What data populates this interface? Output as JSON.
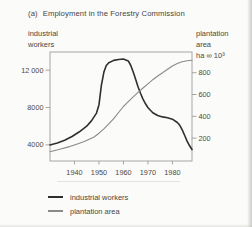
{
  "labels": {
    "title_index": "(a)",
    "title_text": "Employment in the Forestry Commission",
    "left_axis_line1": "industrial",
    "left_axis_line2": "workers",
    "right_axis_line1": "plantation",
    "right_axis_line2": "area",
    "right_axis_line3": "ha ∞ 10³"
  },
  "legend": {
    "items": [
      {
        "label": "industrial workers"
      },
      {
        "label": "plantation area"
      }
    ]
  },
  "colors": {
    "industrial_line": "#2f2f2f",
    "plantation_line": "#8a8a8a",
    "axis": "#9c9c9c",
    "text": "#4a4a4a",
    "background": "#fbfbf9"
  },
  "chart_data": {
    "type": "line",
    "grid": false,
    "legend_position": "bottom-left",
    "x_axis": {
      "label": "year",
      "range": [
        1930,
        1988
      ],
      "ticks": [
        {
          "v": 1940,
          "label": "1940"
        },
        {
          "v": 1950,
          "label": "1950"
        },
        {
          "v": 1960,
          "label": "1960"
        },
        {
          "v": 1970,
          "label": "1970"
        },
        {
          "v": 1980,
          "label": "1980"
        }
      ]
    },
    "left_axis": {
      "label": "industrial workers",
      "range": [
        2270,
        13950
      ],
      "ticks": [
        {
          "v": 4000,
          "label": "4000"
        },
        {
          "v": 8000,
          "label": "8000"
        },
        {
          "v": 12000,
          "label": "12 000"
        }
      ]
    },
    "right_axis": {
      "label": "plantation area ha ∞ 10³",
      "range": [
        -10,
        990
      ],
      "ticks": [
        {
          "v": 200,
          "label": "200"
        },
        {
          "v": 400,
          "label": "400"
        },
        {
          "v": 600,
          "label": "600"
        },
        {
          "v": 800,
          "label": "800"
        }
      ]
    },
    "series": [
      {
        "name": "industrial workers",
        "axis": "left",
        "color": "#2f2f2f",
        "width": 1.6,
        "points": [
          [
            1930,
            4000
          ],
          [
            1933,
            4200
          ],
          [
            1936,
            4500
          ],
          [
            1939,
            4900
          ],
          [
            1942,
            5400
          ],
          [
            1945,
            6000
          ],
          [
            1947,
            6600
          ],
          [
            1949,
            7400
          ],
          [
            1950,
            8300
          ],
          [
            1951,
            10400
          ],
          [
            1952,
            11800
          ],
          [
            1953,
            12500
          ],
          [
            1954,
            12800
          ],
          [
            1956,
            13050
          ],
          [
            1958,
            13150
          ],
          [
            1960,
            13200
          ],
          [
            1962,
            13000
          ],
          [
            1963,
            12500
          ],
          [
            1964,
            11800
          ],
          [
            1965,
            11000
          ],
          [
            1966,
            10200
          ],
          [
            1967,
            9500
          ],
          [
            1968,
            8900
          ],
          [
            1969,
            8400
          ],
          [
            1970,
            8000
          ],
          [
            1971,
            7700
          ],
          [
            1972,
            7450
          ],
          [
            1974,
            7150
          ],
          [
            1976,
            7000
          ],
          [
            1978,
            6900
          ],
          [
            1980,
            6750
          ],
          [
            1982,
            6400
          ],
          [
            1983,
            6100
          ],
          [
            1984,
            5600
          ],
          [
            1985,
            5000
          ],
          [
            1986,
            4400
          ],
          [
            1987,
            3900
          ],
          [
            1988,
            3500
          ]
        ]
      },
      {
        "name": "plantation area",
        "axis": "right",
        "color": "#8a8a8a",
        "width": 1.1,
        "points": [
          [
            1930,
            75
          ],
          [
            1934,
            98
          ],
          [
            1938,
            122
          ],
          [
            1940,
            138
          ],
          [
            1944,
            168
          ],
          [
            1948,
            210
          ],
          [
            1950,
            245
          ],
          [
            1952,
            285
          ],
          [
            1954,
            330
          ],
          [
            1956,
            378
          ],
          [
            1958,
            435
          ],
          [
            1960,
            490
          ],
          [
            1962,
            535
          ],
          [
            1964,
            578
          ],
          [
            1966,
            620
          ],
          [
            1968,
            660
          ],
          [
            1970,
            698
          ],
          [
            1972,
            736
          ],
          [
            1974,
            770
          ],
          [
            1976,
            800
          ],
          [
            1978,
            832
          ],
          [
            1980,
            862
          ],
          [
            1982,
            884
          ],
          [
            1984,
            900
          ],
          [
            1986,
            910
          ],
          [
            1988,
            915
          ]
        ]
      }
    ]
  }
}
